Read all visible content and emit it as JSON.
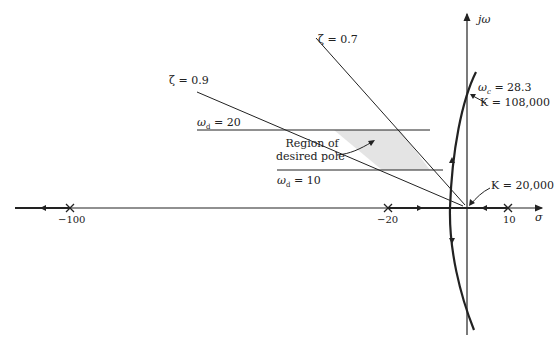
{
  "diagram": {
    "type": "root-locus",
    "axes": {
      "real_axis_label": "σ",
      "imag_axis_label": "jω"
    },
    "poles": [
      {
        "label": "−100",
        "value": -100
      },
      {
        "label": "−20",
        "value": -20
      },
      {
        "label": "10",
        "value": 10
      }
    ],
    "damping_lines": [
      {
        "label": "ζ = 0.9",
        "zeta": 0.9
      },
      {
        "label": "ζ = 0.7",
        "zeta": 0.7
      }
    ],
    "frequency_lines": [
      {
        "label": "ω",
        "sub": "d",
        "rest": " = 20",
        "value": 20
      },
      {
        "label": "ω",
        "sub": "d",
        "rest": " = 10",
        "value": 10
      }
    ],
    "region_label_line1": "Region of",
    "region_label_line2": "desired pole",
    "crossing": {
      "omega_label": "ω",
      "omega_sub": "c",
      "omega_rest": " = 28.3",
      "gain_label": "K = 108,000"
    },
    "breakaway_gain_label": "K = 20,000",
    "colors": {
      "line": "#222222",
      "region_fill": "#e4e4e4"
    }
  }
}
